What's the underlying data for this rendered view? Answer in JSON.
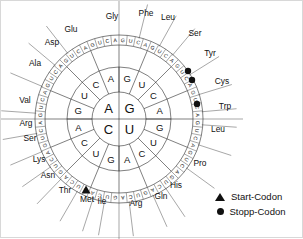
{
  "diagram": {
    "center": {
      "cx": 118,
      "cy": 118
    },
    "radii": {
      "r_inner": 27,
      "r_ring1": 52,
      "r_ring2": 74,
      "r_ring3": 84
    },
    "rotation_offset_deg": -90,
    "ring_inner_bases": [
      "G",
      "U",
      "C",
      "A"
    ],
    "ring2_bases": [
      "G",
      "U",
      "C",
      "A",
      "G",
      "U",
      "C",
      "A",
      "G",
      "U",
      "C",
      "A",
      "G",
      "U",
      "C",
      "A"
    ],
    "ring3_bases": [
      "G",
      "U",
      "C",
      "A",
      "G",
      "U",
      "C",
      "A",
      "G",
      "U",
      "C",
      "A",
      "G",
      "U",
      "C",
      "A",
      "G",
      "U",
      "C",
      "A",
      "G",
      "U",
      "C",
      "A",
      "G",
      "U",
      "C",
      "A",
      "G",
      "U",
      "C",
      "A",
      "G",
      "U",
      "C",
      "A",
      "G",
      "U",
      "C",
      "A",
      "G",
      "U",
      "C",
      "A",
      "G",
      "U",
      "C",
      "A",
      "G",
      "U",
      "C",
      "A",
      "G",
      "U",
      "C",
      "A",
      "G",
      "U",
      "C",
      "A",
      "G",
      "U",
      "C",
      "A"
    ],
    "amino_acids": [
      {
        "label": "Gly",
        "angle_deg": -76,
        "tx": 111,
        "ty": 15,
        "anchor": "middle"
      },
      {
        "label": "Phe",
        "angle_deg": -61,
        "tx": 145,
        "ty": 12,
        "anchor": "middle"
      },
      {
        "label": "Leu",
        "angle_deg": -50,
        "tx": 167,
        "ty": 16,
        "anchor": "middle"
      },
      {
        "label": "Ser",
        "angle_deg": -32,
        "tx": 194,
        "ty": 32,
        "anchor": "middle"
      },
      {
        "label": "Tyr",
        "angle_deg": -17,
        "tx": 209,
        "ty": 52,
        "anchor": "middle"
      },
      {
        "label": "Cys",
        "angle_deg": -5,
        "tx": 221,
        "ty": 80,
        "anchor": "middle"
      },
      {
        "label": "Trp",
        "angle_deg": 4,
        "tx": 224,
        "ty": 105,
        "anchor": "middle"
      },
      {
        "label": "Leu",
        "angle_deg": 18,
        "tx": 217,
        "ty": 128,
        "anchor": "middle"
      },
      {
        "label": "Pro",
        "angle_deg": 36,
        "tx": 199,
        "ty": 162,
        "anchor": "middle"
      },
      {
        "label": "His",
        "angle_deg": 56,
        "tx": 175,
        "ty": 184,
        "anchor": "middle"
      },
      {
        "label": "Gln",
        "angle_deg": 66,
        "tx": 160,
        "ty": 195,
        "anchor": "middle"
      },
      {
        "label": "Arg",
        "angle_deg": 83,
        "tx": 135,
        "ty": 202,
        "anchor": "middle"
      },
      {
        "label": "Ile",
        "angle_deg": 100,
        "tx": 101,
        "ty": 200,
        "anchor": "middle"
      },
      {
        "label": "Met",
        "angle_deg": 108,
        "tx": 86,
        "ty": 198,
        "anchor": "middle"
      },
      {
        "label": "Thr",
        "angle_deg": 120,
        "tx": 64,
        "ty": 189,
        "anchor": "middle"
      },
      {
        "label": "Asn",
        "angle_deg": 134,
        "tx": 47,
        "ty": 174,
        "anchor": "middle"
      },
      {
        "label": "Lys",
        "angle_deg": 145,
        "tx": 38,
        "ty": 158,
        "anchor": "middle"
      },
      {
        "label": "Ser",
        "angle_deg": 157,
        "tx": 29,
        "ty": 137,
        "anchor": "middle"
      },
      {
        "label": "Arg",
        "angle_deg": 170,
        "tx": 25,
        "ty": 122,
        "anchor": "middle"
      },
      {
        "label": "Val",
        "angle_deg": -176,
        "tx": 24,
        "ty": 99,
        "anchor": "middle"
      },
      {
        "label": "Ala",
        "angle_deg": -157,
        "tx": 34,
        "ty": 62,
        "anchor": "middle"
      },
      {
        "label": "Asp",
        "angle_deg": -140,
        "tx": 51,
        "ty": 41,
        "anchor": "middle"
      },
      {
        "label": "Glu",
        "angle_deg": -128,
        "tx": 70,
        "ty": 28,
        "anchor": "middle"
      }
    ],
    "start_codon_marker": {
      "codon": "AUG",
      "x": 85,
      "y": 189
    },
    "stop_codon_markers": [
      {
        "codon": "UAA",
        "x": 187,
        "y": 70
      },
      {
        "codon": "UAG",
        "x": 191,
        "y": 79
      },
      {
        "codon": "UGA",
        "x": 196,
        "y": 103
      }
    ]
  },
  "legend": {
    "start": {
      "label": "Start-Codon",
      "marker": "triangle-icon"
    },
    "stop": {
      "label": "Stopp-Codon",
      "marker": "circle-icon"
    }
  }
}
